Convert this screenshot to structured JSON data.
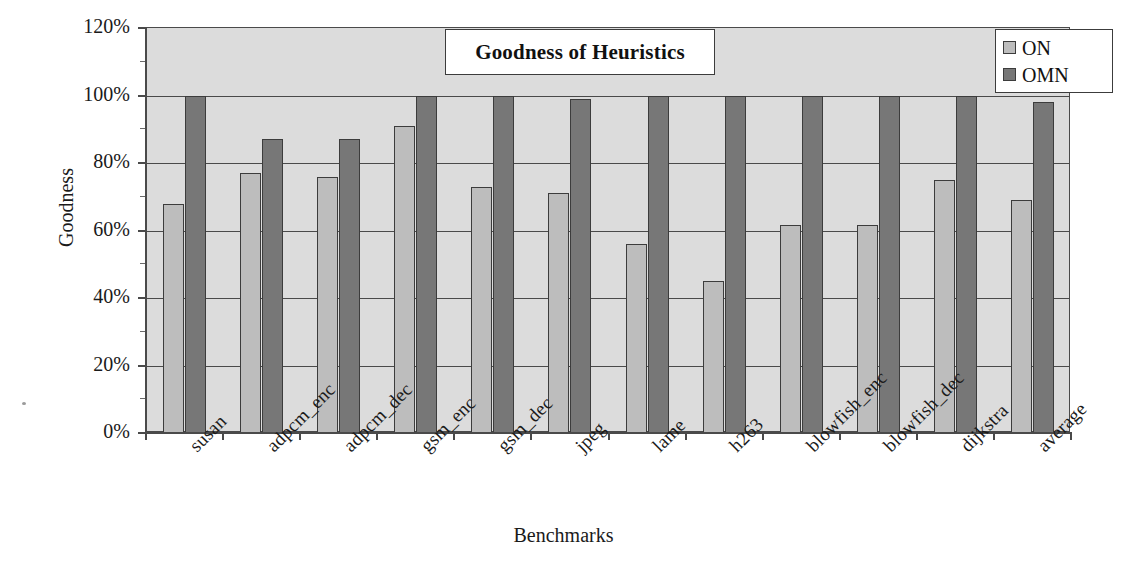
{
  "chart_data": {
    "type": "bar",
    "title": "Goodness of Heuristics",
    "xlabel": "Benchmarks",
    "ylabel": "Goodness",
    "categories": [
      "susan",
      "adpcm_enc",
      "adpcm_dec",
      "gsm_enc",
      "gsm_dec",
      "jpeg",
      "lame",
      "h263",
      "blowfish_enc",
      "blowfish_dec",
      "dijkstra",
      "average"
    ],
    "series": [
      {
        "name": "ON",
        "color": "#bdbdbd",
        "values": [
          68,
          77,
          76,
          91,
          73,
          71,
          56,
          45,
          61.5,
          61.5,
          75,
          69
        ]
      },
      {
        "name": "OMN",
        "color": "#777777",
        "values": [
          100,
          87,
          87,
          100,
          100,
          99,
          100,
          100,
          100,
          100,
          100,
          98
        ]
      }
    ],
    "ylim": [
      0,
      120
    ],
    "yticks": [
      0,
      20,
      40,
      60,
      80,
      100,
      120
    ],
    "ytick_labels": [
      "0%",
      "20%",
      "40%",
      "60%",
      "80%",
      "100%",
      "120%"
    ],
    "grid": true,
    "legend_position": "top-right",
    "value_unit": "%"
  },
  "legend": {
    "entries": [
      {
        "label": "ON",
        "swatch": "light-gray-swatch"
      },
      {
        "label": "OMN",
        "swatch": "dark-gray-swatch"
      }
    ]
  },
  "colors": {
    "plot_background": "#dcdcdc",
    "axis": "#4a4a4a",
    "series_on": "#bdbdbd",
    "series_omn": "#777777",
    "text": "#1a1a1a"
  }
}
